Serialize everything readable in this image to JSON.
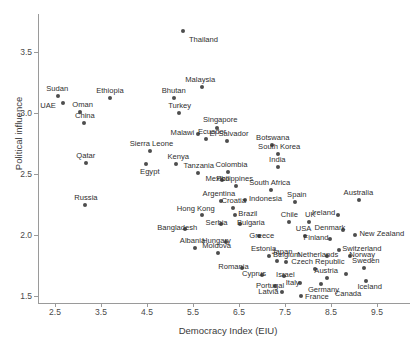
{
  "chart_data": {
    "type": "scatter",
    "title": "",
    "xlabel": "Democracy Index (EIU)",
    "ylabel": "Political influence",
    "xlim": [
      2.1,
      10.2
    ],
    "ylim": [
      1.38,
      3.78
    ],
    "xticks": [
      2.5,
      3.5,
      4.5,
      5.5,
      6.5,
      7.5,
      8.5,
      9.5
    ],
    "yticks": [
      1.5,
      2.0,
      2.5,
      3.0,
      3.5
    ],
    "grid": false,
    "legend": null,
    "point_color": "#4d4d4d",
    "axis_color": "#9a9a9a",
    "points": [
      {
        "label": "Thailand",
        "x": 5.28,
        "y": 3.67,
        "lx": 6,
        "ly": 5
      },
      {
        "label": "Malaysia",
        "x": 5.7,
        "y": 3.21,
        "lx": -17,
        "ly": -11
      },
      {
        "label": "Sudan",
        "x": 2.57,
        "y": 3.14,
        "lx": -12,
        "ly": -11
      },
      {
        "label": "Ethiopia",
        "x": 3.7,
        "y": 3.12,
        "lx": -14,
        "ly": -11
      },
      {
        "label": "Bhutan",
        "x": 5.08,
        "y": 3.12,
        "lx": -12,
        "ly": -11
      },
      {
        "label": "UAE",
        "x": 2.68,
        "y": 3.08,
        "lx": -23,
        "ly": -1
      },
      {
        "label": "Oman",
        "x": 3.05,
        "y": 3.01,
        "lx": -8,
        "ly": -11
      },
      {
        "label": "Turkey",
        "x": 5.2,
        "y": 3.0,
        "lx": -11,
        "ly": -11
      },
      {
        "label": "China",
        "x": 3.13,
        "y": 2.92,
        "lx": -9,
        "ly": -11
      },
      {
        "label": "Singapore",
        "x": 6.02,
        "y": 2.88,
        "lx": -14,
        "ly": -12
      },
      {
        "label": "Malawi",
        "x": 5.6,
        "y": 2.83,
        "lx": -27,
        "ly": -5
      },
      {
        "label": "Ecuador",
        "x": 5.78,
        "y": 2.79,
        "lx": -8,
        "ly": -11
      },
      {
        "label": "El Salvador",
        "x": 6.23,
        "y": 2.77,
        "lx": -17,
        "ly": -11
      },
      {
        "label": "Botswana",
        "x": 7.22,
        "y": 2.74,
        "lx": -16,
        "ly": -11
      },
      {
        "label": "Sierra Leone",
        "x": 4.56,
        "y": 2.69,
        "lx": -20,
        "ly": -11
      },
      {
        "label": "South Korea",
        "x": 7.35,
        "y": 2.66,
        "lx": -20,
        "ly": -11
      },
      {
        "label": "Qatar",
        "x": 3.18,
        "y": 2.59,
        "lx": -10,
        "ly": -11
      },
      {
        "label": "Kenya",
        "x": 5.14,
        "y": 2.58,
        "lx": -9,
        "ly": -11
      },
      {
        "label": "Egypt",
        "x": 4.48,
        "y": 2.58,
        "lx": -6,
        "ly": 4
      },
      {
        "label": "India",
        "x": 7.35,
        "y": 2.56,
        "lx": -9,
        "ly": -11
      },
      {
        "label": "Tanzania",
        "x": 5.6,
        "y": 2.51,
        "lx": -14,
        "ly": -11
      },
      {
        "label": "Colombia",
        "x": 6.27,
        "y": 2.52,
        "lx": -13,
        "ly": -11
      },
      {
        "label": "Mexico",
        "x": 6.12,
        "y": 2.45,
        "lx": -16,
        "ly": -5
      },
      {
        "label": "South Africa",
        "x": 7.2,
        "y": 2.37,
        "lx": -22,
        "ly": -11
      },
      {
        "label": "Philippines",
        "x": 6.44,
        "y": 2.4,
        "lx": -20,
        "ly": -11
      },
      {
        "label": "Russia",
        "x": 3.16,
        "y": 2.25,
        "lx": -11,
        "ly": -11
      },
      {
        "label": "Argentina",
        "x": 6.1,
        "y": 2.28,
        "lx": -18,
        "ly": -11
      },
      {
        "label": "Indonesia",
        "x": 6.63,
        "y": 2.29,
        "lx": 4,
        "ly": -5
      },
      {
        "label": "Spain",
        "x": 7.72,
        "y": 2.27,
        "lx": -8,
        "ly": -11
      },
      {
        "label": "Australia",
        "x": 9.1,
        "y": 2.29,
        "lx": -15,
        "ly": -11
      },
      {
        "label": "Croatia",
        "x": 6.38,
        "y": 2.22,
        "lx": -12,
        "ly": -11
      },
      {
        "label": "Hong Kong",
        "x": 5.69,
        "y": 2.16,
        "lx": -25,
        "ly": -10
      },
      {
        "label": "Brazil",
        "x": 6.42,
        "y": 2.16,
        "lx": 3,
        "ly": -5
      },
      {
        "label": "Ireland",
        "x": 8.65,
        "y": 2.16,
        "lx": -26,
        "ly": -6
      },
      {
        "label": "Chile",
        "x": 7.58,
        "y": 2.11,
        "lx": -8,
        "ly": -11
      },
      {
        "label": "UK",
        "x": 8.02,
        "y": 2.11,
        "lx": -4,
        "ly": -11
      },
      {
        "label": "Serbia",
        "x": 6.1,
        "y": 2.09,
        "lx": -15,
        "ly": -5
      },
      {
        "label": "Bulgaria",
        "x": 6.52,
        "y": 2.09,
        "lx": -3,
        "ly": -5
      },
      {
        "label": "Bangladesh",
        "x": 5.33,
        "y": 2.05,
        "lx": -28,
        "ly": -5
      },
      {
        "label": "Denmark",
        "x": 8.75,
        "y": 2.04,
        "lx": -28,
        "ly": -6
      },
      {
        "label": "Greece",
        "x": 6.94,
        "y": 1.99,
        "lx": -10,
        "ly": -4
      },
      {
        "label": "USA",
        "x": 7.93,
        "y": 1.99,
        "lx": -9,
        "ly": -11
      },
      {
        "label": "Finland",
        "x": 8.47,
        "y": 1.97,
        "lx": -26,
        "ly": -5
      },
      {
        "label": "New Zealand",
        "x": 9.03,
        "y": 2.0,
        "lx": 4,
        "ly": -5
      },
      {
        "label": "Hungary",
        "x": 6.22,
        "y": 1.94,
        "lx": -24,
        "ly": -5
      },
      {
        "label": "Albania",
        "x": 5.54,
        "y": 1.89,
        "lx": -15,
        "ly": -11
      },
      {
        "label": "Switzerland",
        "x": 8.68,
        "y": 1.88,
        "lx": 3,
        "ly": -5
      },
      {
        "label": "Moldova",
        "x": 6.05,
        "y": 1.85,
        "lx": -16,
        "ly": -11
      },
      {
        "label": "Estonia",
        "x": 7.15,
        "y": 1.83,
        "lx": -18,
        "ly": -11
      },
      {
        "label": "Japan",
        "x": 7.32,
        "y": 1.79,
        "lx": -5,
        "ly": -13
      },
      {
        "label": "Netherlands",
        "x": 8.42,
        "y": 1.83,
        "lx": -30,
        "ly": -5
      },
      {
        "label": "Norway",
        "x": 8.92,
        "y": 1.83,
        "lx": -1,
        "ly": -5
      },
      {
        "label": "Belgium",
        "x": 7.52,
        "y": 1.78,
        "lx": -13,
        "ly": -11
      },
      {
        "label": "Romania",
        "x": 6.57,
        "y": 1.73,
        "lx": -24,
        "ly": -5
      },
      {
        "label": "Czech Republic",
        "x": 8.16,
        "y": 1.72,
        "lx": -24,
        "ly": -11
      },
      {
        "label": "Sweden",
        "x": 9.22,
        "y": 1.73,
        "lx": -12,
        "ly": -11
      },
      {
        "label": "Cyprus",
        "x": 7.0,
        "y": 1.67,
        "lx": -20,
        "ly": -5
      },
      {
        "label": "Israel",
        "x": 7.48,
        "y": 1.66,
        "lx": -8,
        "ly": -5
      },
      {
        "label": "Austria",
        "x": 8.42,
        "y": 1.65,
        "lx": -13,
        "ly": -11
      },
      {
        "label": "Italy",
        "x": 7.82,
        "y": 1.61,
        "lx": -14,
        "ly": -4
      },
      {
        "label": "Portugal",
        "x": 7.28,
        "y": 1.58,
        "lx": -19,
        "ly": -4
      },
      {
        "label": "Germany",
        "x": 8.28,
        "y": 1.6,
        "lx": -13,
        "ly": 2
      },
      {
        "label": "Iceland",
        "x": 9.27,
        "y": 1.62,
        "lx": -9,
        "ly": 2
      },
      {
        "label": "Canada",
        "x": 8.82,
        "y": 1.68,
        "lx": -11,
        "ly": 16
      },
      {
        "label": "Latvia",
        "x": 7.44,
        "y": 1.53,
        "lx": -24,
        "ly": -4
      },
      {
        "label": "France",
        "x": 7.85,
        "y": 1.5,
        "lx": 4,
        "ly": -3
      }
    ]
  }
}
